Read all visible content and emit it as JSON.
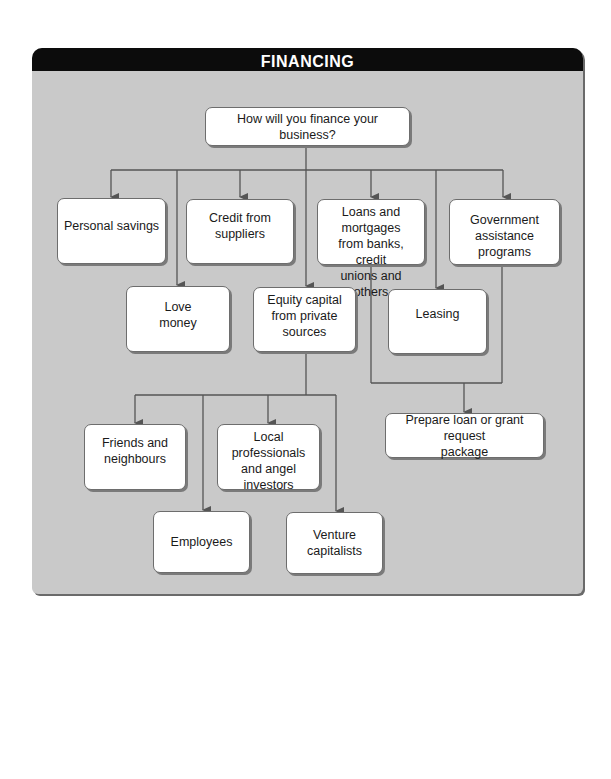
{
  "header": {
    "title": "FINANCING"
  },
  "colors": {
    "panel_bg": "#c9c9c9",
    "header_bg": "#0c0c0c",
    "box_bg": "#ffffff",
    "line": "#555555"
  },
  "nodes": {
    "root": "How will you finance your business?",
    "personal_savings": "Personal savings",
    "credit_suppliers": "Credit from\nsuppliers",
    "loans_mortgages": "Loans and mortgages\nfrom banks, credit\nunions and others",
    "government_programs": "Government\nassistance programs",
    "love_money": "Love\nmoney",
    "equity_capital": "Equity capital\nfrom private\nsources",
    "leasing": "Leasing",
    "prepare_package": "Prepare loan or grant request\npackage",
    "friends_neighbours": "Friends and\nneighbours",
    "local_professionals": "Local professionals\nand angel\ninvestors",
    "employees": "Employees",
    "venture_capitalists": "Venture\ncapitalists"
  },
  "edges": [
    [
      "root",
      "personal_savings"
    ],
    [
      "root",
      "love_money"
    ],
    [
      "root",
      "credit_suppliers"
    ],
    [
      "root",
      "equity_capital"
    ],
    [
      "root",
      "loans_mortgages"
    ],
    [
      "root",
      "leasing"
    ],
    [
      "root",
      "government_programs"
    ],
    [
      "loans_mortgages",
      "prepare_package"
    ],
    [
      "government_programs",
      "prepare_package"
    ],
    [
      "equity_capital",
      "friends_neighbours"
    ],
    [
      "equity_capital",
      "employees"
    ],
    [
      "equity_capital",
      "local_professionals"
    ],
    [
      "equity_capital",
      "venture_capitalists"
    ]
  ]
}
